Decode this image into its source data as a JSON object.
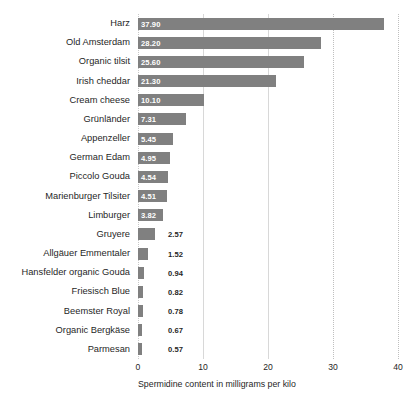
{
  "chart_data": {
    "type": "bar",
    "orientation": "horizontal",
    "title": "",
    "subtitle": "",
    "xlabel": "Spermidine content in milligrams per kilo",
    "ylabel": "",
    "xlim": [
      0,
      40
    ],
    "xticks": [
      0,
      10,
      20,
      30,
      40
    ],
    "xtick_labels": [
      "0",
      "10",
      "20",
      "30",
      "40"
    ],
    "grid": true,
    "grid_axis": "x",
    "legend": false,
    "bar_color": "#808080",
    "value_label_inside_color": "#ffffff",
    "value_label_outside_color": "#1f1f1f",
    "categories": [
      "Harz",
      "Old Amsterdam",
      "Organic tilsit",
      "Irish cheddar",
      "Cream cheese",
      "Grünländer",
      "Appenzeller",
      "German Edam",
      "Piccolo Gouda",
      "Marienburger Tilsiter",
      "Limburger",
      "Gruyere",
      "Allgäuer Emmentaler",
      "Hansfelder organic Gouda",
      "Friesisch Blue",
      "Beemster Royal",
      "Organic Bergkäse",
      "Parmesan"
    ],
    "values": [
      37.9,
      28.2,
      25.6,
      21.3,
      10.1,
      7.31,
      5.45,
      4.95,
      4.54,
      4.51,
      3.82,
      2.57,
      1.52,
      0.94,
      0.82,
      0.78,
      0.67,
      0.57
    ],
    "value_labels": [
      "37.90",
      "28.20",
      "25.60",
      "21.30",
      "10.10",
      "7.31",
      "5.45",
      "4.95",
      "4.54",
      "4.51",
      "3.82",
      "2.57",
      "1.52",
      "0.94",
      "0.82",
      "0.78",
      "0.67",
      "0.57"
    ]
  }
}
